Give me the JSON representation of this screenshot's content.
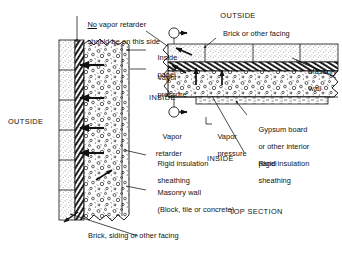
{
  "figure": {
    "title_caption": "TOP SECTION",
    "orientation_labels": {
      "outside_left": "OUTSIDE",
      "outside_top_right": "OUTSIDE",
      "inside_left": "INSIDE",
      "inside_right": "INSIDE"
    },
    "marker_label": "C",
    "labels": {
      "no_vapor_retarder": {
        "emphasis": "No",
        "line1_rest": " vapor retarder",
        "line2": "should be on this side",
        "full": "No vapor retarder should be on this side"
      },
      "inside_panel": {
        "line1": "Inside",
        "line2": "panel",
        "full": "Inside panel"
      },
      "vapor_pressure_left": {
        "line1": "Vapor",
        "line2": "pressure",
        "full": "Vapor pressure"
      },
      "vapor_retarder": {
        "line1": "Vapor",
        "line2": "retarder",
        "full": "Vapor retarder"
      },
      "rigid_insulation_left": {
        "line1": "Rigid insulation",
        "line2": "sheathing",
        "full": "Rigid insulation sheathing"
      },
      "masonry_wall_left": {
        "line1": "Masonry wall",
        "line2": "(Block, tile or concrete)",
        "full": "Masonry wall (Block, tile or concrete)"
      },
      "brick_siding_facing": {
        "full": "Brick, siding or other facing"
      },
      "brick_or_other_facing": {
        "full": "Brick or other facing"
      },
      "masonry_wall_right": {
        "line1": "Masonry",
        "line2": "wall",
        "full": "Masonry wall"
      },
      "gypsum_board": {
        "line1": "Gypsum board",
        "line2": "or other interior",
        "line3": "panel",
        "full": "Gypsum board or other interior panel"
      },
      "vapor_pressure_right": {
        "line1": "Vapor",
        "line2": "pressure",
        "full": "Vapor pressure"
      },
      "rigid_insulation_right": {
        "line1": "Rigid insulation",
        "line2": "sheathing",
        "full": "Rigid insulation sheathing"
      }
    },
    "colors": {
      "ink": "#111111",
      "background": "#ffffff",
      "hatch": "#1a1a1a",
      "stipple": "#2b2b2b"
    }
  }
}
